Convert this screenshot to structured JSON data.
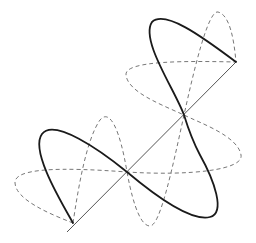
{
  "diagram": {
    "title": "",
    "colors": {
      "background": "#ffffff",
      "axis": "#555555",
      "solid_wave": "#1a1a1a",
      "dashed_wave": "#777777"
    },
    "elements": [
      {
        "name": "propagation-axis",
        "style": "solid-thin"
      },
      {
        "name": "resultant-wave",
        "style": "solid-thick",
        "lobes": 3
      },
      {
        "name": "horizontal-component-wave",
        "style": "dashed",
        "lobes": 3
      },
      {
        "name": "vertical-component-wave",
        "style": "dashed",
        "lobes": 3
      }
    ]
  }
}
